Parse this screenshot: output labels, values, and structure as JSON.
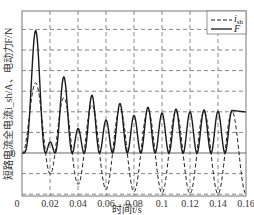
{
  "chart_data": {
    "type": "line",
    "title": "",
    "xlabel": "时间t/s",
    "ylabel": "短路电流全电流i_sh/A、电动力F/N",
    "xlim": [
      0,
      0.16
    ],
    "x_ticks": [
      "0",
      "0.02",
      "0.04",
      "0.06",
      "0.08",
      "0.1",
      "0.12",
      "0.14",
      "0.16"
    ],
    "y_ticks": [
      "0"
    ],
    "y_units_note": "y values in gridline units (1 unit = one horizontal grid spacing); no numeric y tick labels shown except 0",
    "ylim": [
      -2.1,
      6.9
    ],
    "grid": true,
    "legend_position": "upper right",
    "legend": [
      {
        "label": "i",
        "subscript": "sh",
        "style": "dashed"
      },
      {
        "label": "F",
        "subscript": "",
        "style": "solid"
      }
    ],
    "series": [
      {
        "name": "i_sh",
        "style": "dashed",
        "x": [
          0,
          0.01,
          0.02,
          0.03,
          0.04,
          0.05,
          0.06,
          0.07,
          0.08,
          0.09,
          0.1,
          0.11,
          0.12,
          0.13,
          0.14,
          0.15,
          0.16
        ],
        "values": [
          0,
          3.4,
          -0.68,
          2.82,
          -1.17,
          2.43,
          -1.55,
          2.18,
          -1.75,
          2.1,
          -1.65,
          2.05,
          -1.89,
          2.02,
          -1.89,
          2.0,
          -2.04
        ]
      },
      {
        "name": "F",
        "style": "solid",
        "x": [
          0,
          0.0107,
          0.02,
          0.03,
          0.04,
          0.05,
          0.06,
          0.07,
          0.08,
          0.09,
          0.1,
          0.11,
          0.12,
          0.13,
          0.14,
          0.15,
          0.16
        ],
        "values": [
          0,
          5.92,
          0.29,
          3.88,
          0.97,
          2.91,
          1.36,
          2.43,
          1.6,
          2.23,
          1.8,
          2.14,
          1.89,
          2.04,
          1.94,
          1.99,
          1.99
        ]
      }
    ],
    "model": {
      "Ip": 2.0,
      "tau": 0.028,
      "omega": 314.159,
      "k_force": 0.512
    }
  },
  "colors": {
    "line": "#1a1a1a",
    "grid": "#555555",
    "frame": "#777777",
    "text": "#333333"
  }
}
